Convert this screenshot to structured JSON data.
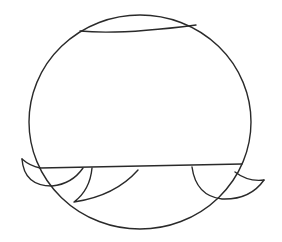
{
  "canvas": {
    "width": 282,
    "height": 242,
    "background": "#ffffff",
    "stroke_color": "#2a2a2a"
  },
  "drawing": {
    "description": "Line sketch of a large circle with a flattened top chord, a horizontal line near the bottom, and curved fin/wave shapes along the lower edge"
  }
}
